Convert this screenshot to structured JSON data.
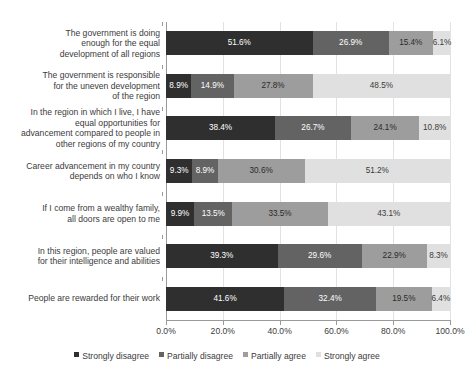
{
  "chart_data": {
    "type": "bar",
    "orientation": "horizontal",
    "stacked": true,
    "stack_mode": "percent",
    "title": "",
    "subtitle": "",
    "xlabel": "",
    "ylabel": "",
    "xlim": [
      0,
      100
    ],
    "grid": true,
    "legend_position": "bottom",
    "xtick_labels": [
      "0.0%",
      "20.0%",
      "40.0%",
      "60.0%",
      "80.0%",
      "100.0%"
    ],
    "xticks": [
      0,
      20,
      40,
      60,
      80,
      100
    ],
    "categories": [
      "The government is doing enough for the equal development of all  regions",
      "The government is responsible for the uneven development of the region",
      "In the region in which I live, I have equal opportunities for advancement compared to people in other regions of my country",
      "Career advancement in my country depends on who I know",
      "If I come from a wealthy family, all doors are open to me",
      "In this region, people are valued for their intelligence and abilities",
      "People are rewarded for their work"
    ],
    "series": [
      {
        "name": "Strongly disagree",
        "color": "#2f2f2f",
        "values": [
          51.6,
          8.9,
          38.4,
          9.3,
          9.9,
          39.3,
          41.6
        ],
        "labels": [
          "51.6%",
          "8.9%",
          "38.4%",
          "9.3%",
          "9.9%",
          "39.3%",
          "41.6%"
        ]
      },
      {
        "name": "Partially disagree",
        "color": "#636363",
        "values": [
          26.9,
          14.9,
          26.7,
          8.9,
          13.5,
          29.6,
          32.4
        ],
        "labels": [
          "26.9%",
          "14.9%",
          "26.7%",
          "8.9%",
          "13.5%",
          "29.6%",
          "32.4%"
        ]
      },
      {
        "name": "Partially agree",
        "color": "#9d9d9d",
        "values": [
          15.4,
          27.8,
          24.1,
          30.6,
          33.5,
          22.9,
          19.5
        ],
        "labels": [
          "15.4%",
          "27.8%",
          "24.1%",
          "30.6%",
          "33.5%",
          "22.9%",
          "19.5%"
        ]
      },
      {
        "name": "Strongly agree",
        "color": "#e0e0e0",
        "values": [
          6.1,
          48.5,
          10.8,
          51.2,
          43.1,
          8.3,
          6.4
        ],
        "labels": [
          "6.1%",
          "48.5%",
          "10.8%",
          "51.2%",
          "43.1%",
          "8.3%",
          "6.4%"
        ]
      }
    ]
  },
  "category_label_lines": [
    [
      "The government is doing",
      "enough for the equal",
      "development of all  regions"
    ],
    [
      "The government is responsible",
      "for the uneven development",
      "of the region"
    ],
    [
      "In the region in which I live, I have",
      "equal opportunities for",
      "advancement compared to people in",
      "other regions of my country"
    ],
    [
      "Career advancement in my country",
      "depends on who I know"
    ],
    [
      "If I come from a wealthy family,",
      "all doors are open to me"
    ],
    [
      "In this region, people are valued",
      "for their intelligence and abilities"
    ],
    [
      "People are rewarded for their work"
    ]
  ]
}
